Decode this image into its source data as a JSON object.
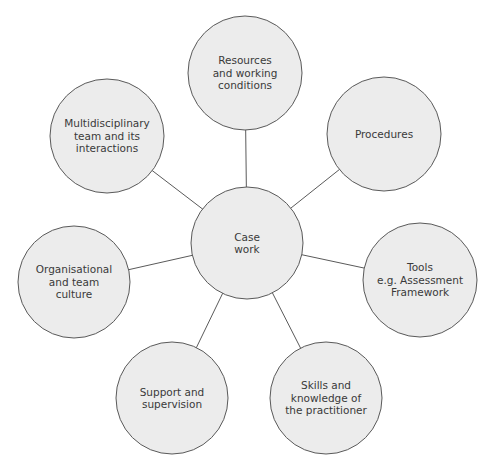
{
  "diagram": {
    "center": {
      "id": "case-work",
      "label": "Case\nwork",
      "cx": 247,
      "cy": 243,
      "r": 56
    },
    "nodes": [
      {
        "id": "resources",
        "label": "Resources\nand working\nconditions",
        "cx": 245,
        "cy": 73,
        "r": 57
      },
      {
        "id": "procedures",
        "label": "Procedures",
        "cx": 384,
        "cy": 134,
        "r": 57
      },
      {
        "id": "tools",
        "label": "Tools\ne.g. Assessment\nFramework",
        "cx": 420,
        "cy": 280,
        "r": 57
      },
      {
        "id": "skills",
        "label": "Skills and\nknowledge of\nthe practitioner",
        "cx": 326,
        "cy": 398,
        "r": 56
      },
      {
        "id": "support",
        "label": "Support and\nsupervision",
        "cx": 172,
        "cy": 398,
        "r": 56
      },
      {
        "id": "organisational",
        "label": "Organisational\nand team\nculture",
        "cx": 74,
        "cy": 282,
        "r": 56
      },
      {
        "id": "multidisciplinary",
        "label": "Multidisciplinary\nteam and its\ninteractions",
        "cx": 107,
        "cy": 136,
        "r": 57
      }
    ],
    "colors": {
      "circle_fill": "#ececec",
      "circle_stroke": "#5a5a5a",
      "connector": "#5a5a5a",
      "text": "#3a3a3a"
    }
  }
}
